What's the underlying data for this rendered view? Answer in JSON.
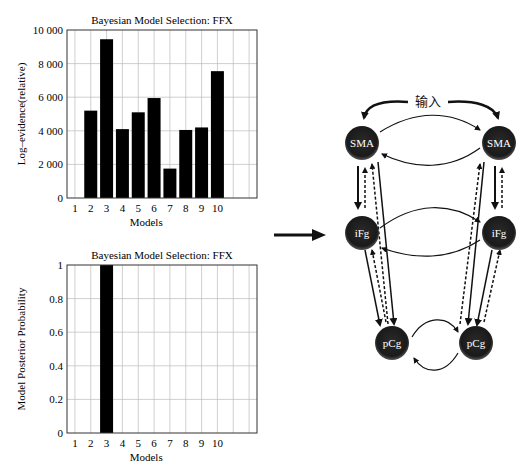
{
  "figure": {
    "arrow_between": "right-arrow"
  },
  "chart_data": [
    {
      "type": "bar",
      "title": "Bayesian Model Selection: FFX",
      "xlabel": "Models",
      "ylabel": "Log–evidence(relative)",
      "categories": [
        "1",
        "2",
        "3",
        "4",
        "5",
        "6",
        "7",
        "8",
        "9",
        "10"
      ],
      "values": [
        0,
        5200,
        9450,
        4100,
        5100,
        5950,
        1750,
        4050,
        4200,
        7550
      ],
      "ylim": [
        0,
        10000
      ],
      "yticks": [
        0,
        2000,
        4000,
        6000,
        8000,
        10000
      ],
      "ytick_labels": [
        "0",
        "2 000",
        "4 000",
        "6 000",
        "8 000",
        "10 000"
      ],
      "grid": true,
      "bar_color": "#000000"
    },
    {
      "type": "bar",
      "title": "Bayesian Model Selection: FFX",
      "xlabel": "Models",
      "ylabel": "Model Posterior Probability",
      "categories": [
        "1",
        "2",
        "3",
        "4",
        "5",
        "6",
        "7",
        "8",
        "9",
        "10"
      ],
      "values": [
        0,
        0,
        1,
        0,
        0,
        0,
        0,
        0,
        0,
        0
      ],
      "ylim": [
        0,
        1
      ],
      "yticks": [
        0,
        0.2,
        0.4,
        0.6,
        0.8,
        1
      ],
      "ytick_labels": [
        "0",
        "0.2",
        "0.4",
        "0.6",
        "0.8",
        "1"
      ],
      "grid": true,
      "bar_color": "#000000"
    }
  ],
  "diagram": {
    "input_label": "输入",
    "nodes": [
      {
        "id": "sma-left",
        "label": "SMA"
      },
      {
        "id": "sma-right",
        "label": "SMA"
      },
      {
        "id": "ifg-left",
        "label": "iFg"
      },
      {
        "id": "ifg-right",
        "label": "iFg"
      },
      {
        "id": "pcg-left",
        "label": "pCg"
      },
      {
        "id": "pcg-right",
        "label": "pCg"
      }
    ],
    "node_color": "#1a1a1a",
    "node_text_color": "#ffffff"
  }
}
